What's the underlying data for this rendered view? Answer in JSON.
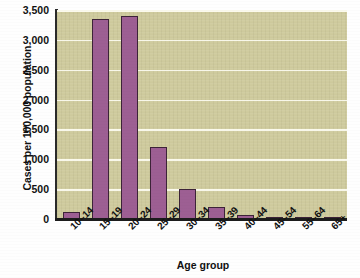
{
  "chart_data": {
    "type": "bar",
    "title": "",
    "subtitle": "",
    "xlabel": "Age group",
    "ylabel": "Cases per 100,000 population",
    "categories": [
      "10–14",
      "15–19",
      "20–24",
      "25–29",
      "30–34",
      "35–39",
      "40–44",
      "45–54",
      "55–64",
      "65+"
    ],
    "values": [
      125,
      3350,
      3400,
      1200,
      500,
      200,
      75,
      30,
      10,
      3
    ],
    "ylim": [
      0,
      3500
    ],
    "yticks": [
      0,
      500,
      1000,
      1500,
      2000,
      2500,
      3000,
      3500
    ],
    "ytick_labels": [
      "0",
      "500",
      "1,000",
      "1,500",
      "2,000",
      "2,500",
      "3,000",
      "3,500"
    ],
    "grid": true,
    "legend": false,
    "legend_position": "none",
    "bar_color": "#9d5f93",
    "bar_edge_color": "#3d2338",
    "plot_background": "#cfcb9e",
    "gridline_color": "#fdfcf0",
    "figure_background": "#fefefe",
    "text_color": "#111111"
  }
}
